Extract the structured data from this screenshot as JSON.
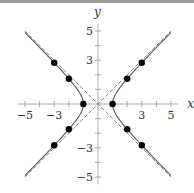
{
  "chart_data": {
    "type": "line",
    "title": "",
    "xlabel": "x",
    "ylabel": "y",
    "xlim": [
      -5.5,
      5.5
    ],
    "ylim": [
      -5.5,
      5.5
    ],
    "grid": false,
    "x_ticks_labeled": [
      "-5",
      "-3",
      "3",
      "5"
    ],
    "y_ticks_labeled": [
      "5",
      "3",
      "-3",
      "-5"
    ],
    "series": [
      {
        "name": "hyperbola x^2 - y^2 = 1",
        "style": "solid"
      },
      {
        "name": "asymptote y = x",
        "style": "dashed"
      },
      {
        "name": "asymptote y = -x",
        "style": "dashed"
      }
    ],
    "points": [
      [
        1,
        0
      ],
      [
        -1,
        0
      ],
      [
        2,
        1.73
      ],
      [
        2,
        -1.73
      ],
      [
        -2,
        1.73
      ],
      [
        -2,
        -1.73
      ],
      [
        3,
        2.83
      ],
      [
        3,
        -2.83
      ],
      [
        -3,
        2.83
      ],
      [
        -3,
        -2.83
      ]
    ]
  }
}
